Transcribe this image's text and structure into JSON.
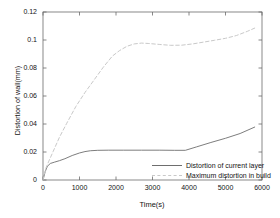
{
  "chart_data": {
    "type": "line",
    "title": "",
    "xlabel": "Time(s)",
    "ylabel": "Distortion of wall(mm)",
    "xlim": [
      0,
      6000
    ],
    "ylim": [
      0,
      0.12
    ],
    "xticks": [
      "0",
      "1000",
      "2000",
      "3000",
      "4000",
      "5000",
      "6000"
    ],
    "xtick_values": [
      0,
      1000,
      2000,
      3000,
      4000,
      5000,
      6000
    ],
    "yticks": [
      "0",
      "0.02",
      "0.04",
      "0.06",
      "0.08",
      "0.1",
      "0.12"
    ],
    "ytick_values": [
      0,
      0.02,
      0.04,
      0.06,
      0.08,
      0.1,
      0.12
    ],
    "grid": false,
    "legend_position": "lower right",
    "series": [
      {
        "name": "Distortion of current layer",
        "style": "solid",
        "color": "#6e6e6e",
        "x": [
          0,
          60,
          120,
          200,
          320,
          450,
          600,
          800,
          1000,
          1150,
          1300,
          1500,
          1800,
          2200,
          2700,
          3200,
          3600,
          3900,
          4200,
          4600,
          5000,
          5400,
          5800
        ],
        "y": [
          0.0,
          0.006,
          0.0098,
          0.0118,
          0.0128,
          0.0138,
          0.0152,
          0.0175,
          0.0193,
          0.0203,
          0.0209,
          0.0212,
          0.0213,
          0.0213,
          0.0213,
          0.0213,
          0.0212,
          0.0212,
          0.0236,
          0.0268,
          0.0298,
          0.0332,
          0.0378
        ]
      },
      {
        "name": "Maximum distortion in build",
        "style": "dashed",
        "color": "#c9c9c9",
        "x": [
          0,
          80,
          160,
          280,
          450,
          650,
          900,
          1150,
          1400,
          1650,
          1900,
          2100,
          2300,
          2500,
          2700,
          2900,
          3200,
          3500,
          3800,
          4100,
          4400,
          4700,
          5000,
          5300,
          5600,
          5800
        ],
        "y": [
          0.0,
          0.0085,
          0.0135,
          0.0205,
          0.0305,
          0.0405,
          0.0525,
          0.0625,
          0.0715,
          0.0805,
          0.0885,
          0.0925,
          0.0955,
          0.0972,
          0.0978,
          0.0975,
          0.0968,
          0.0962,
          0.0963,
          0.0972,
          0.0985,
          0.0998,
          0.1012,
          0.1032,
          0.1062,
          0.1085
        ]
      }
    ]
  }
}
